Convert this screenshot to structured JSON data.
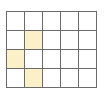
{
  "grid": {
    "rows": 4,
    "cols": 5,
    "highlight_color": "#fcf0c8",
    "line_color": "#6b6b6b",
    "cell_color": "#ffffff",
    "highlighted_cells": [
      {
        "row": 1,
        "col": 1
      },
      {
        "row": 2,
        "col": 0
      },
      {
        "row": 3,
        "col": 1
      }
    ]
  }
}
